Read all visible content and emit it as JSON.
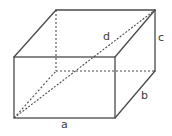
{
  "diagram": {
    "type": "rectangular-prism",
    "labels": {
      "a": "a",
      "b": "b",
      "c": "c",
      "d": "d"
    },
    "colors": {
      "line": "#4a4a4a",
      "background": "#ffffff"
    }
  }
}
